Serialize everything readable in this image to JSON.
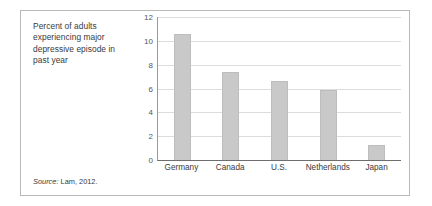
{
  "figure": {
    "caption": "Percent of adults experiencing major depressive episode in past year",
    "source_label": "Source:",
    "source_value": " Lam, 2012."
  },
  "chart_data": {
    "type": "bar",
    "title": "Percent of adults experiencing major depressive episode in past year",
    "xlabel": "",
    "ylabel": "",
    "categories": [
      "Germany",
      "Canada",
      "U.S.",
      "Netherlands",
      "Japan"
    ],
    "values": [
      10.6,
      7.4,
      6.6,
      5.9,
      1.3
    ],
    "ylim": [
      0,
      12
    ],
    "yticks": [
      0,
      2,
      4,
      6,
      8,
      10,
      12
    ],
    "ytick_labels": [
      "0",
      "2",
      "4",
      "6",
      "8",
      "10",
      "12"
    ],
    "grid": true,
    "legend": false,
    "bar_color": "#c9c9c9",
    "gridline_color": "#dcdcdc",
    "axis_color": "#6e6e6e",
    "source": "Source: Lam, 2012."
  }
}
